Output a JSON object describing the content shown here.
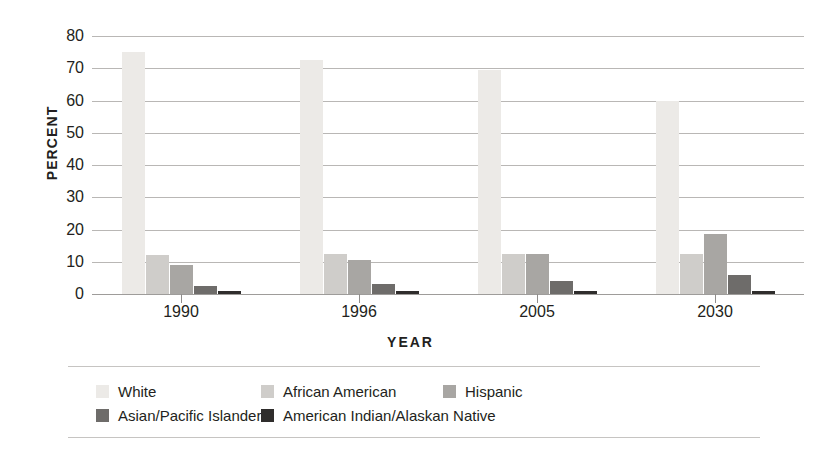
{
  "title_fragment": "",
  "axis": {
    "ylabel": "PERCENT",
    "xlabel": "YEAR",
    "yticks": [
      "80",
      "70",
      "60",
      "50",
      "40",
      "30",
      "20",
      "10",
      "0"
    ]
  },
  "legend": {
    "items": [
      {
        "label": "White",
        "color": "#eceae7"
      },
      {
        "label": "African American",
        "color": "#cfcdca"
      },
      {
        "label": "Hispanic",
        "color": "#a8a6a3"
      },
      {
        "label": "Asian/Pacific Islander",
        "color": "#6e6c6a"
      },
      {
        "label": "American Indian/Alaskan Native",
        "color": "#2f2d2c"
      }
    ]
  },
  "chart_data": {
    "type": "bar",
    "title": "",
    "xlabel": "YEAR",
    "ylabel": "PERCENT",
    "ylim": [
      0,
      80
    ],
    "ytick_step": 10,
    "grid": true,
    "legend_position": "bottom",
    "categories": [
      "1990",
      "1996",
      "2005",
      "2030"
    ],
    "series": [
      {
        "name": "White",
        "color": "#eceae7",
        "values": [
          75.0,
          72.5,
          69.5,
          60.0
        ]
      },
      {
        "name": "African American",
        "color": "#cfcdca",
        "values": [
          12.0,
          12.5,
          12.5,
          12.5
        ]
      },
      {
        "name": "Hispanic",
        "color": "#a8a6a3",
        "values": [
          9.0,
          10.5,
          12.5,
          18.5
        ]
      },
      {
        "name": "Asian/Pacific Islander",
        "color": "#6e6c6a",
        "values": [
          2.5,
          3.0,
          4.0,
          6.0
        ]
      },
      {
        "name": "American Indian/Alaskan Native",
        "color": "#2f2d2c",
        "values": [
          1.0,
          1.0,
          1.0,
          1.0
        ]
      }
    ]
  }
}
